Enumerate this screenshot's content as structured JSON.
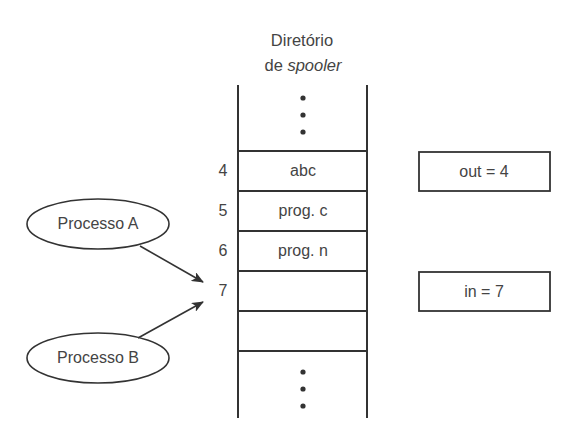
{
  "title": {
    "line1": "Diretório",
    "line2_prefix": "de ",
    "line2_italic": "spooler"
  },
  "directory": {
    "slots": [
      {
        "index": "4",
        "value": "abc"
      },
      {
        "index": "5",
        "value": "prog. c"
      },
      {
        "index": "6",
        "value": "prog. n"
      },
      {
        "index": "7",
        "value": ""
      },
      {
        "index": "",
        "value": ""
      }
    ],
    "ellipsis_top": "⋮",
    "ellipsis_bottom": "⋮"
  },
  "processes": [
    {
      "label": "Processo A"
    },
    {
      "label": "Processo B"
    }
  ],
  "pointers": {
    "out": "out = 4",
    "in": "in = 7"
  },
  "colors": {
    "line": "#333333",
    "text": "#444444",
    "background": "#ffffff"
  }
}
